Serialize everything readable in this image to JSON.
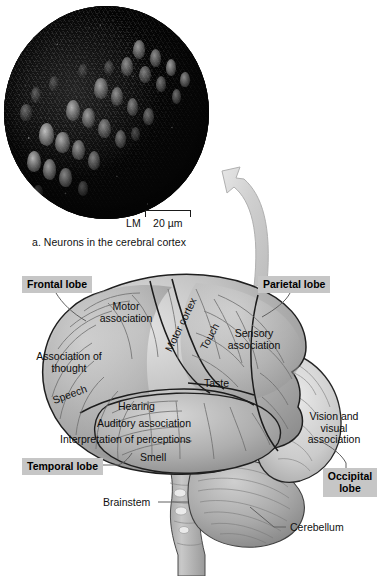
{
  "figure": {
    "panel_a": {
      "caption": "a. Neurons in the cerebral cortex",
      "micrograph_alt": "neurons-micrograph",
      "scalebar": {
        "method": "LM",
        "value": "20 µm"
      }
    },
    "connector": {
      "arrow_name": "curved-arrow-from-brain-to-micrograph"
    },
    "brain": {
      "lobes": [
        {
          "id": "frontal",
          "label": "Frontal lobe"
        },
        {
          "id": "parietal",
          "label": "Parietal lobe"
        },
        {
          "id": "temporal",
          "label": "Temporal lobe"
        },
        {
          "id": "occipital",
          "label": "Occipital lobe"
        }
      ],
      "areas": [
        {
          "id": "motor-association",
          "label": "Motor association"
        },
        {
          "id": "motor-cortex",
          "label": "Motor cortex"
        },
        {
          "id": "touch",
          "label": "Touch"
        },
        {
          "id": "sensory-association",
          "label": "Sensory association"
        },
        {
          "id": "association-of-thought",
          "label": "Association of thought"
        },
        {
          "id": "speech",
          "label": "Speech"
        },
        {
          "id": "taste",
          "label": "Taste"
        },
        {
          "id": "hearing",
          "label": "Hearing"
        },
        {
          "id": "auditory-association",
          "label": "Auditory association"
        },
        {
          "id": "interpretation-of-perceptions",
          "label": "Interpretation of perceptions"
        },
        {
          "id": "smell",
          "label": "Smell"
        },
        {
          "id": "vision-and-visual-association",
          "label": "Vision and visual association"
        }
      ],
      "structures": [
        {
          "id": "brainstem",
          "label": "Brainstem"
        },
        {
          "id": "cerebellum",
          "label": "Cerebellum"
        }
      ]
    }
  },
  "colors": {
    "background": "#ffffff",
    "label_box_fill": "#c6c6c6",
    "text": "#111111",
    "leader_line": "#555555",
    "brain_outline": "#1a1a1a",
    "brain_fill_light": "#d8d8d8",
    "brain_fill_mid": "#b4b4b4",
    "brain_fill_dark": "#8f8f8f",
    "arrow_fill": "#d5d5d5",
    "micrograph_dark": "#060606"
  }
}
